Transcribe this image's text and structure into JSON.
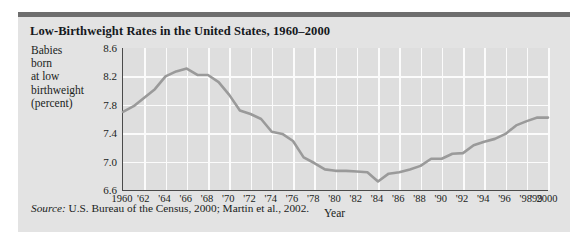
{
  "figure": {
    "title": "Low-Birthweight Rates in the United States, 1960–2000",
    "source_word": "Source:",
    "source_text": " U.S. Bureau of the Census, 2000; Martin et al., 2002."
  },
  "axis_label_lines": [
    "Babies",
    "born",
    "at low",
    "birthweight",
    "(percent)"
  ],
  "colors": {
    "panel_background": "#e3e3e3",
    "plot_background": "#dedede",
    "top_rule": "#6e6e6e",
    "gridline": "#fbfbfb",
    "axis": "#4a4a4a",
    "line": "#9a9a9a",
    "text": "#1a1d21"
  },
  "chart_data": {
    "type": "line",
    "title": "Low-Birthweight Rates in the United States, 1960–2000",
    "xlabel": "Year",
    "ylabel": "Babies born at low birthweight (percent)",
    "xlim": [
      1960,
      2000
    ],
    "ylim": [
      6.6,
      8.6
    ],
    "yticks": [
      8.6,
      8.2,
      7.8,
      7.4,
      7.0,
      6.6
    ],
    "ytick_labels": [
      "8.6",
      "8.2",
      "7.8",
      "7.4",
      "7.0",
      "6.6"
    ],
    "xticks": [
      1960,
      1962,
      1964,
      1966,
      1968,
      1970,
      1972,
      1974,
      1976,
      1978,
      1980,
      1982,
      1984,
      1986,
      1988,
      1990,
      1992,
      1994,
      1996,
      1998,
      1999,
      2000
    ],
    "xtick_labels": [
      "1960",
      "'62",
      "'64",
      "'66",
      "'68",
      "'70",
      "'72",
      "'74",
      "'76",
      "'78",
      "'80",
      "'82",
      "'84",
      "'86",
      "'88",
      "'90",
      "'92",
      "'94",
      "'96",
      "'98",
      "'99",
      "2000"
    ],
    "grid": true,
    "legend": null,
    "series": [
      {
        "name": "Low-birthweight rate",
        "x": [
          1960,
          1961,
          1962,
          1963,
          1964,
          1965,
          1966,
          1967,
          1968,
          1969,
          1970,
          1971,
          1972,
          1973,
          1974,
          1975,
          1976,
          1977,
          1978,
          1979,
          1980,
          1981,
          1982,
          1983,
          1984,
          1985,
          1986,
          1987,
          1988,
          1989,
          1990,
          1991,
          1992,
          1993,
          1994,
          1995,
          1996,
          1997,
          1998,
          1999,
          2000
        ],
        "values": [
          7.7,
          7.78,
          7.9,
          8.02,
          8.2,
          8.27,
          8.31,
          8.22,
          8.22,
          8.12,
          7.94,
          7.72,
          7.67,
          7.6,
          7.42,
          7.39,
          7.29,
          7.06,
          6.98,
          6.89,
          6.87,
          6.87,
          6.86,
          6.85,
          6.72,
          6.83,
          6.85,
          6.89,
          6.94,
          7.04,
          7.04,
          7.11,
          7.12,
          7.23,
          7.28,
          7.32,
          7.39,
          7.51,
          7.57,
          7.62,
          7.62
        ]
      }
    ]
  }
}
